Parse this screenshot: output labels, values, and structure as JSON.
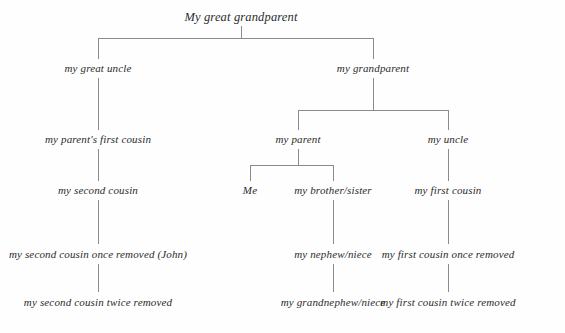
{
  "diagram": {
    "title_node": "My great grandparent",
    "type": "family-tree",
    "background_color": "#fefefe",
    "line_color": "#8a8a8a",
    "text_color": "#2b2b2b",
    "nodes": {
      "great_grandparent": "My great grandparent",
      "great_uncle": "my great uncle",
      "grandparent": "my grandparent",
      "parents_first_cousin": "my parent's first cousin",
      "parent": "my parent",
      "uncle": "my uncle",
      "second_cousin": "my second cousin",
      "me": "Me",
      "brother_sister": "my brother/sister",
      "first_cousin": "my first cousin",
      "second_cousin_once_removed": "my second cousin once removed (John)",
      "nephew_niece": "my nephew/niece",
      "first_cousin_once_removed": "my first cousin once removed",
      "second_cousin_twice_removed": "my second cousin twice removed",
      "grandnephew_niece": "my grandnephew/niece",
      "first_cousin_twice_removed": "my first cousin twice removed"
    },
    "generations": [
      {
        "level": 0,
        "labels": [
          "My great grandparent"
        ]
      },
      {
        "level": 1,
        "labels": [
          "my great uncle",
          "my grandparent"
        ]
      },
      {
        "level": 2,
        "labels": [
          "my parent's first cousin",
          "my parent",
          "my uncle"
        ]
      },
      {
        "level": 3,
        "labels": [
          "my second cousin",
          "Me",
          "my brother/sister",
          "my first cousin"
        ]
      },
      {
        "level": 4,
        "labels": [
          "my second cousin once removed (John)",
          "my nephew/niece",
          "my first cousin once removed"
        ]
      },
      {
        "level": 5,
        "labels": [
          "my second cousin twice removed",
          "my grandnephew/niece",
          "my first cousin twice removed"
        ]
      }
    ],
    "edges": [
      {
        "from": "My great grandparent",
        "to": "my great uncle"
      },
      {
        "from": "My great grandparent",
        "to": "my grandparent"
      },
      {
        "from": "my great uncle",
        "to": "my parent's first cousin"
      },
      {
        "from": "my grandparent",
        "to": "my parent"
      },
      {
        "from": "my grandparent",
        "to": "my uncle"
      },
      {
        "from": "my parent's first cousin",
        "to": "my second cousin"
      },
      {
        "from": "my parent",
        "to": "Me"
      },
      {
        "from": "my parent",
        "to": "my brother/sister"
      },
      {
        "from": "my uncle",
        "to": "my first cousin"
      },
      {
        "from": "my second cousin",
        "to": "my second cousin once removed (John)"
      },
      {
        "from": "my brother/sister",
        "to": "my nephew/niece"
      },
      {
        "from": "my first cousin",
        "to": "my first cousin once removed"
      },
      {
        "from": "my second cousin once removed (John)",
        "to": "my second cousin twice removed"
      },
      {
        "from": "my nephew/niece",
        "to": "my grandnephew/niece"
      },
      {
        "from": "my first cousin once removed",
        "to": "my first cousin twice removed"
      }
    ]
  }
}
